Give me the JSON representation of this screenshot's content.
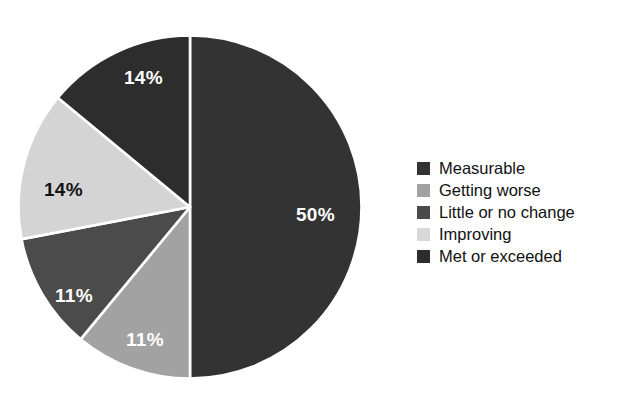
{
  "title": {
    "text_cutoff": "Status of Measures"
  },
  "chart_data": {
    "type": "pie",
    "title": "Status of Measures",
    "xlabel": "",
    "ylabel": "",
    "unit": "percent",
    "categories": [
      "Measurable",
      "Getting worse",
      "Little or no change",
      "Improving",
      "Met or exceeded"
    ],
    "values": [
      50,
      11,
      11,
      14,
      14
    ],
    "labels": [
      "50%",
      "11%",
      "11%",
      "14%",
      "14%"
    ],
    "colors": [
      "#333333",
      "#a2a2a2",
      "#4b4b4b",
      "#d4d4d4",
      "#2d2d2d"
    ],
    "label_colors": [
      "#ffffff",
      "#ffffff",
      "#ffffff",
      "#121212",
      "#ffffff"
    ],
    "start_angle_deg": 0,
    "direction": "clockwise",
    "separator_color": "#ffffff",
    "legend_position": "right",
    "grid": false
  },
  "legend": {
    "entries": [
      {
        "label": "Measurable",
        "color": "#333333"
      },
      {
        "label": "Getting worse",
        "color": "#a2a2a2"
      },
      {
        "label": "Little or no change",
        "color": "#4b4b4b"
      },
      {
        "label": "Improving",
        "color": "#d8d8d8"
      },
      {
        "label": "Met or exceeded",
        "color": "#2d2d2d"
      }
    ]
  },
  "slice_labels": [
    {
      "text": "50%",
      "tone": "light",
      "left": 296,
      "top": 205
    },
    {
      "text": "11%",
      "tone": "light",
      "left": 126,
      "top": 330
    },
    {
      "text": "11%",
      "tone": "light",
      "left": 55,
      "top": 286
    },
    {
      "text": "14%",
      "tone": "dark",
      "left": 44,
      "top": 180
    },
    {
      "text": "14%",
      "tone": "light",
      "left": 124,
      "top": 68
    }
  ]
}
